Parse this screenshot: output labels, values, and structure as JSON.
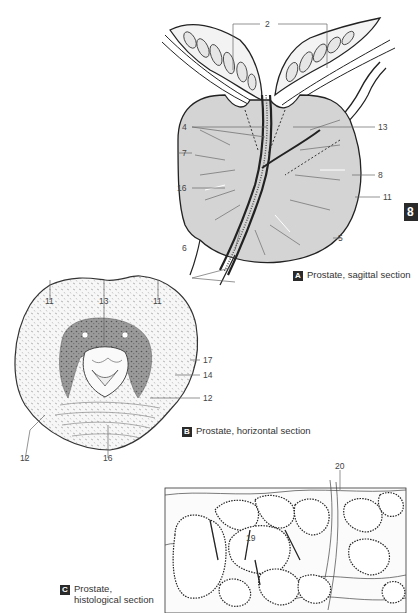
{
  "page": {
    "chapter_tab": "8",
    "background": "#ffffff",
    "accent_dark": "#2a2a2a",
    "tissue_gray": "#d4d4d4"
  },
  "figures": {
    "A": {
      "badge": "A",
      "caption": "Prostate, sagittal section",
      "labels": [
        {
          "id": "2",
          "text": "2"
        },
        {
          "id": "4",
          "text": "4"
        },
        {
          "id": "13",
          "text": "13"
        },
        {
          "id": "7",
          "text": "7"
        },
        {
          "id": "8",
          "text": "8"
        },
        {
          "id": "16",
          "text": "16"
        },
        {
          "id": "11",
          "text": "11"
        },
        {
          "id": "6",
          "text": "6"
        },
        {
          "id": "5",
          "text": "5"
        }
      ]
    },
    "B": {
      "badge": "B",
      "caption": "Prostate, horizontal section",
      "labels": [
        {
          "id": "11a",
          "text": "11"
        },
        {
          "id": "13",
          "text": "13"
        },
        {
          "id": "11b",
          "text": "11"
        },
        {
          "id": "17",
          "text": "17"
        },
        {
          "id": "14",
          "text": "14"
        },
        {
          "id": "12a",
          "text": "12"
        },
        {
          "id": "12b",
          "text": "12"
        },
        {
          "id": "16",
          "text": "16"
        }
      ]
    },
    "C": {
      "badge": "C",
      "caption_line1": "Prostate,",
      "caption_line2": "histological section",
      "labels": [
        {
          "id": "20",
          "text": "20"
        },
        {
          "id": "19",
          "text": "19"
        }
      ]
    }
  }
}
